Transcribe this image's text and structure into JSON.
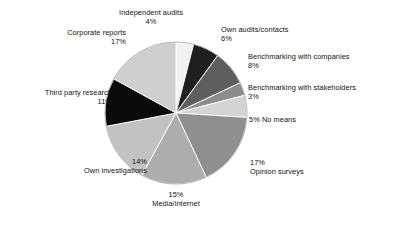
{
  "chart_data": {
    "type": "pie",
    "title": "",
    "subtitle": "",
    "xlabel": "",
    "ylabel": "",
    "legend_position": "none",
    "grid": false,
    "label_format": "category + percent",
    "start_angle_deg": 0,
    "direction": "clockwise",
    "total_percent": 100,
    "categories": [
      "Independent audits",
      "Own audits/contacts",
      "Benchmarking with companies",
      "Benchmarking with stakeholders",
      "No means",
      "Opinion surveys",
      "Media/internet",
      "Own investigations",
      "Third party research",
      "Corporate reports"
    ],
    "values": [
      4,
      6,
      8,
      3,
      5,
      17,
      15,
      14,
      11,
      17
    ],
    "colors": [
      "#f2f2f2",
      "#1f1f1f",
      "#5e5e5e",
      "#8c8c8c",
      "#d4d4d4",
      "#8f8f8f",
      "#adadad",
      "#c2c2c2",
      "#0a0a0a",
      "#cfcfcf"
    ],
    "slices": [
      {
        "label": "Independent audits",
        "value": 4,
        "percent_text": "4%",
        "color": "#f2f2f2"
      },
      {
        "label": "Own audits/contacts",
        "value": 6,
        "percent_text": "6%",
        "color": "#1f1f1f"
      },
      {
        "label": "Benchmarking with companies",
        "value": 8,
        "percent_text": "8%",
        "color": "#5e5e5e"
      },
      {
        "label": "Benchmarking with stakeholders",
        "value": 3,
        "percent_text": "3%",
        "color": "#8c8c8c"
      },
      {
        "label": "No means",
        "value": 5,
        "percent_text": "5%",
        "color": "#d4d4d4"
      },
      {
        "label": "Opinion surveys",
        "value": 17,
        "percent_text": "17%",
        "color": "#8f8f8f"
      },
      {
        "label": "Media/internet",
        "value": 15,
        "percent_text": "15%",
        "color": "#adadad"
      },
      {
        "label": "Own investigations",
        "value": 14,
        "percent_text": "14%",
        "color": "#c2c2c2"
      },
      {
        "label": "Third party research",
        "value": 11,
        "percent_text": "11%",
        "color": "#0a0a0a"
      },
      {
        "label": "Corporate reports",
        "value": 17,
        "percent_text": "17%",
        "color": "#cfcfcf"
      }
    ]
  },
  "labels": {
    "independent_audits": {
      "name": "Independent audits",
      "percent": "4%"
    },
    "own_audits_contacts": {
      "name": "Own audits/contacts",
      "percent": "6%"
    },
    "benchmarking_with_companies": {
      "name": "Benchmarking with companies",
      "percent": "8%"
    },
    "benchmarking_with_stakeholders": {
      "name": "Benchmarking with stakeholders",
      "percent": "3%"
    },
    "no_means": {
      "name": "No means",
      "percent": "5%",
      "combined": "5% No means"
    },
    "opinion_surveys": {
      "name": "Opinion surveys",
      "percent": "17%"
    },
    "media_internet": {
      "name": "Media/internet",
      "percent": "15%"
    },
    "own_investigations": {
      "name": "Own investigations",
      "percent": "14%"
    },
    "third_party_research": {
      "name": "Third party research",
      "percent": "11%"
    },
    "corporate_reports": {
      "name": "Corporate reports",
      "percent": "17%"
    }
  },
  "geometry": {
    "center_x": 176,
    "center_y": 113,
    "radius": 71
  }
}
